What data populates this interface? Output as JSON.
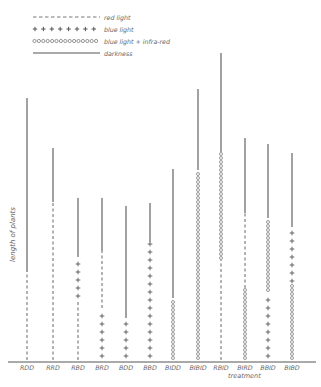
{
  "legend": {
    "items": [
      {
        "style": "dashed",
        "label": "red light"
      },
      {
        "style": "plus",
        "label": "blue light"
      },
      {
        "style": "circle",
        "label": "blue light + infra-red"
      },
      {
        "style": "solid",
        "label": "darkness"
      }
    ]
  },
  "axes": {
    "ylabel": "length of plants",
    "xlabel": "treatment"
  },
  "colors": {
    "line": "#555555",
    "background": "#ffffff"
  },
  "chart_data": {
    "type": "bar",
    "title": "",
    "xlabel": "treatment",
    "ylabel": "length of plants",
    "categories": [
      "RDD",
      "RRD",
      "RBD",
      "BRD",
      "BDD",
      "BBD",
      "BIDD",
      "BIBID",
      "RBID",
      "BIRD",
      "BBID",
      "BIBD"
    ],
    "note": "Stacked vertical line segments; each segment style indicates light treatment phase (bottom to top). Units arbitrary (pixel-scaled, baseline=0).",
    "bars": [
      {
        "label": "RDD",
        "x": 27,
        "segments": [
          {
            "style": "dashed",
            "length": 88
          },
          {
            "style": "solid",
            "length": 174
          }
        ]
      },
      {
        "label": "RRD",
        "x": 53,
        "segments": [
          {
            "style": "dashed",
            "length": 158
          },
          {
            "style": "solid",
            "length": 54
          }
        ]
      },
      {
        "label": "RBD",
        "x": 78,
        "segments": [
          {
            "style": "dashed",
            "length": 60
          },
          {
            "style": "plus",
            "length": 43
          },
          {
            "style": "solid",
            "length": 59
          }
        ]
      },
      {
        "label": "BRD",
        "x": 102,
        "segments": [
          {
            "style": "plus",
            "length": 52
          },
          {
            "style": "dashed",
            "length": 57
          },
          {
            "style": "solid",
            "length": 53
          }
        ]
      },
      {
        "label": "BDD",
        "x": 126,
        "segments": [
          {
            "style": "plus",
            "length": 42
          },
          {
            "style": "solid",
            "length": 112
          }
        ]
      },
      {
        "label": "BBD",
        "x": 150,
        "segments": [
          {
            "style": "plus",
            "length": 118
          },
          {
            "style": "solid",
            "length": 39
          }
        ]
      },
      {
        "label": "BIDD",
        "x": 173,
        "segments": [
          {
            "style": "circle",
            "length": 62
          },
          {
            "style": "solid",
            "length": 129
          }
        ]
      },
      {
        "label": "BIBID",
        "x": 198,
        "segments": [
          {
            "style": "circle",
            "length": 190
          },
          {
            "style": "solid",
            "length": 81
          }
        ]
      },
      {
        "label": "RBID",
        "x": 221,
        "segments": [
          {
            "style": "dashed",
            "length": 100
          },
          {
            "style": "circle",
            "length": 108
          },
          {
            "style": "solid",
            "length": 99
          }
        ]
      },
      {
        "label": "BIRD",
        "x": 245,
        "segments": [
          {
            "style": "circle",
            "length": 72
          },
          {
            "style": "dashed",
            "length": 75
          },
          {
            "style": "solid",
            "length": 75
          }
        ]
      },
      {
        "label": "BBID",
        "x": 268,
        "segments": [
          {
            "style": "plus",
            "length": 68
          },
          {
            "style": "circle",
            "length": 74
          },
          {
            "style": "solid",
            "length": 74
          }
        ]
      },
      {
        "label": "BIBD",
        "x": 292,
        "segments": [
          {
            "style": "circle",
            "length": 75
          },
          {
            "style": "plus",
            "length": 58
          },
          {
            "style": "solid",
            "length": 74
          }
        ]
      }
    ],
    "grid": false,
    "legend_position": "top-left"
  }
}
